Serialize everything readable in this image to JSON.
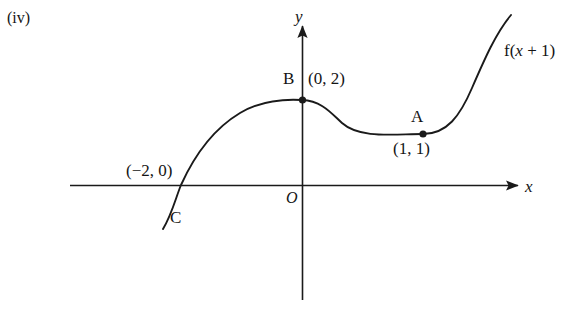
{
  "figure": {
    "part_label": "(iv)",
    "function_label": "f(x + 1)",
    "axes": {
      "x_axis_label": "x",
      "y_axis_label": "y",
      "origin_label": "O"
    },
    "points": [
      {
        "name": "B",
        "label": "B",
        "coordinates": "(0, 2)",
        "x": 0,
        "y": 2
      },
      {
        "name": "A",
        "label": "A",
        "coordinates": "(1, 1)",
        "x": 1,
        "y": 1
      },
      {
        "name": "C",
        "label": "C",
        "coordinates": "(−2, 0)",
        "x": -2,
        "y": 0
      }
    ],
    "x_intercept_label": "(−2, 0)",
    "c_label": "C",
    "colors": {
      "curve": "#1a1a1a",
      "axis": "#1a1a1a",
      "background": "#ffffff",
      "text": "#141414"
    }
  },
  "chart_data": {
    "type": "line",
    "title": "",
    "xlabel": "x",
    "ylabel": "y",
    "grid": false,
    "legend": "none",
    "annotations": [
      {
        "text": "(iv)",
        "position": "top-left"
      },
      {
        "text": "f(x + 1)",
        "position": "top-right",
        "describes": "curve"
      },
      {
        "text": "B",
        "at": [
          0,
          2
        ]
      },
      {
        "text": "(0, 2)",
        "at": [
          0,
          2
        ]
      },
      {
        "text": "A",
        "at": [
          1,
          1
        ]
      },
      {
        "text": "(1, 1)",
        "at": [
          1,
          1
        ]
      },
      {
        "text": "(−2, 0)",
        "at": [
          -2,
          0
        ]
      },
      {
        "text": "C",
        "at": [
          -2,
          0
        ]
      },
      {
        "text": "O",
        "at": [
          0,
          0
        ]
      }
    ],
    "marked_points": [
      {
        "label": "B",
        "x": 0,
        "y": 2
      },
      {
        "label": "A",
        "x": 1,
        "y": 1
      }
    ],
    "series": [
      {
        "name": "f(x + 1)",
        "description": "Cubic-like curve: rises from below-left through the x-axis at (-2, 0), local maximum at B (0, 2), local minimum at A (1, 1), then rises steeply to the right.",
        "x": [
          -2.4,
          -2.0,
          -1.5,
          -1.0,
          -0.5,
          0.0,
          0.3,
          0.6,
          1.0,
          1.4,
          1.8,
          2.2,
          2.6
        ],
        "y": [
          -0.8,
          0.0,
          0.9,
          1.5,
          1.9,
          2.0,
          1.75,
          1.3,
          1.0,
          1.2,
          2.0,
          3.4,
          5.2
        ]
      }
    ],
    "xlim": [
      -3.2,
      3.3
    ],
    "ylim": [
      -3.0,
      5.8
    ]
  }
}
